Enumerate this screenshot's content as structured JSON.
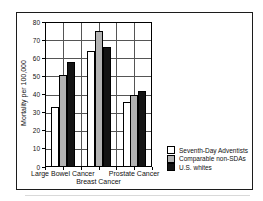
{
  "chart_data": {
    "type": "bar",
    "title": "",
    "xlabel": "",
    "ylabel": "Mortality per 100,000",
    "ylim": [
      0,
      80
    ],
    "ytick_step": 10,
    "grid": true,
    "legend_position": "bottom-right",
    "categories": [
      "Large Bowel Cancer",
      "Breast Cancer",
      "Prostate Cancer"
    ],
    "category_label_row": [
      0,
      1,
      0
    ],
    "series": [
      {
        "name": "Seventh-Day Adventists",
        "color": "#ffffff",
        "values": [
          33,
          64,
          36
        ]
      },
      {
        "name": "Comparable non-SDAs",
        "color": "#b2b2b2",
        "values": [
          51,
          75,
          40
        ]
      },
      {
        "name": "U.S. whites",
        "color": "#141414",
        "values": [
          58,
          66,
          42
        ]
      }
    ]
  }
}
